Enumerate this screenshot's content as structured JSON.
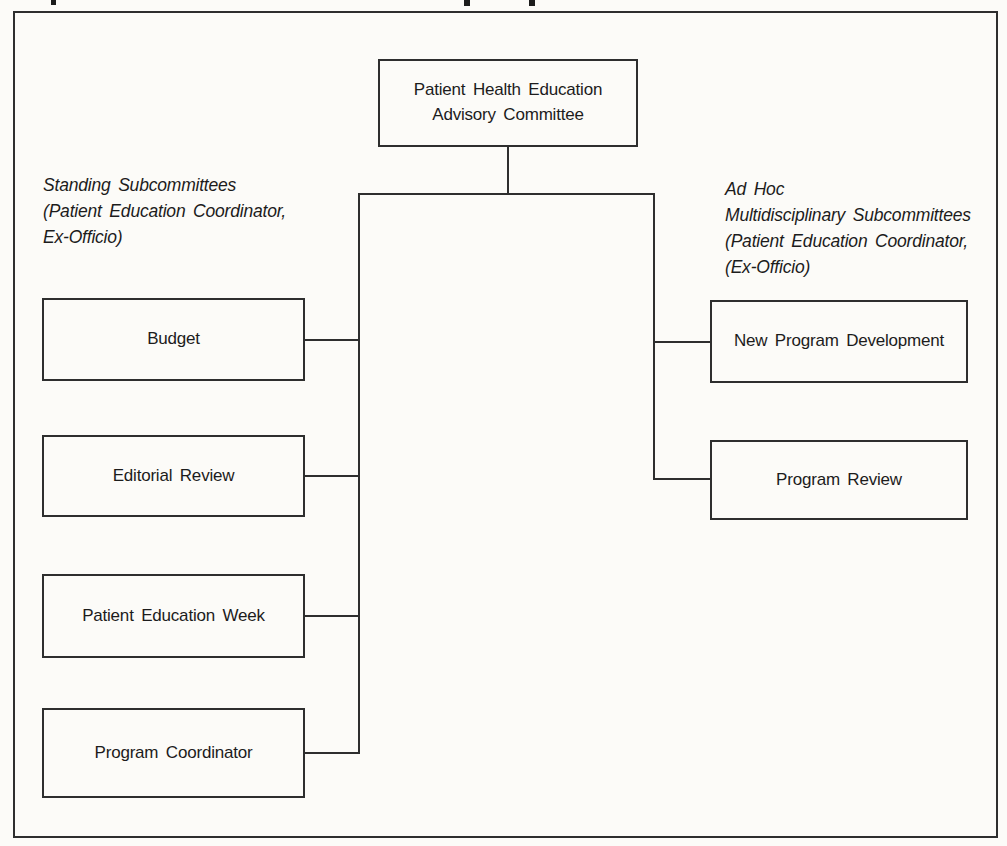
{
  "page": {
    "background_color": "#fcfbf8",
    "line_color": "#2e2e2e",
    "text_color": "#1c1c1c"
  },
  "org_chart": {
    "root": {
      "label_line1": "Patient Health Education",
      "label_line2": "Advisory Committee"
    },
    "left_section": {
      "heading_line1": "Standing Subcommittees",
      "heading_line2": "(Patient Education Coordinator,",
      "heading_line3": "Ex-Officio)",
      "boxes": [
        {
          "label": "Budget"
        },
        {
          "label": "Editorial Review"
        },
        {
          "label": "Patient Education Week"
        },
        {
          "label": "Program Coordinator"
        }
      ]
    },
    "right_section": {
      "heading_line1": "Ad Hoc",
      "heading_line2": "Multidisciplinary Subcommittees",
      "heading_line3": "(Patient Education Coordinator,",
      "heading_line4": "(Ex-Officio)",
      "boxes": [
        {
          "label": "New Program Development"
        },
        {
          "label": "Program Review"
        }
      ]
    }
  }
}
